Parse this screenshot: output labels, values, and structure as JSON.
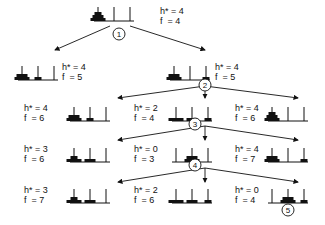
{
  "colors": {
    "ink": "#111111",
    "background": "#ffffff"
  },
  "nodes": [
    {
      "id": "root",
      "h": "h* = 4",
      "f": "f  = 4",
      "step": "1",
      "pegs": [
        [
          3,
          2,
          1
        ],
        [],
        []
      ],
      "x": 94,
      "y": 3,
      "lx": 160,
      "ly": 6
    },
    {
      "id": "n1a",
      "h": "h* = 4",
      "f": "f  = 5",
      "step": "",
      "pegs": [
        [
          3,
          2
        ],
        [
          1
        ],
        []
      ],
      "x": 18,
      "y": 62,
      "lx": 62,
      "ly": 62
    },
    {
      "id": "n1b",
      "h": "h* = 4",
      "f": "f  = 5",
      "step": "2",
      "pegs": [
        [
          3,
          2
        ],
        [],
        [
          1
        ]
      ],
      "x": 170,
      "y": 62,
      "lx": 215,
      "ly": 62
    },
    {
      "id": "n2a",
      "h": "h* = 4",
      "f": "f  = 6",
      "step": "",
      "pegs": [
        [
          3,
          2
        ],
        [
          1
        ],
        []
      ],
      "x": 70,
      "y": 103,
      "lx": 24,
      "ly": 103
    },
    {
      "id": "n2b",
      "h": "h* = 2",
      "f": "f  = 4",
      "step": "3",
      "pegs": [
        [
          3
        ],
        [
          2
        ],
        [
          1
        ]
      ],
      "x": 172,
      "y": 103,
      "lx": 134,
      "ly": 103
    },
    {
      "id": "n2c",
      "h": "h* = 4",
      "f": "f  = 6",
      "step": "",
      "pegs": [
        [
          3,
          2,
          1
        ],
        [],
        []
      ],
      "x": 268,
      "y": 103,
      "lx": 235,
      "ly": 103
    },
    {
      "id": "n3a",
      "h": "h* = 3",
      "f": "f  = 6",
      "step": "",
      "pegs": [
        [
          3,
          1
        ],
        [
          2
        ],
        []
      ],
      "x": 70,
      "y": 144,
      "lx": 24,
      "ly": 144
    },
    {
      "id": "n3b",
      "h": "h* = 0",
      "f": "f  = 3",
      "step": "4",
      "pegs": [
        [],
        [
          3,
          2
        ],
        []
      ],
      "x": 172,
      "y": 144,
      "lx": 134,
      "ly": 144
    },
    {
      "id": "n3c",
      "h": "h* = 4",
      "f": "f  = 7",
      "step": "",
      "pegs": [
        [
          3,
          2
        ],
        [],
        [
          1
        ]
      ],
      "x": 268,
      "y": 144,
      "lx": 235,
      "ly": 144
    },
    {
      "id": "n4a",
      "h": "h* = 3",
      "f": "f  = 7",
      "step": "",
      "pegs": [
        [
          3,
          1
        ],
        [
          2
        ],
        []
      ],
      "x": 70,
      "y": 185,
      "lx": 24,
      "ly": 185
    },
    {
      "id": "n4b",
      "h": "h* = 2",
      "f": "f  = 6",
      "step": "",
      "pegs": [
        [
          3
        ],
        [
          2
        ],
        [
          1
        ]
      ],
      "x": 172,
      "y": 185,
      "lx": 134,
      "ly": 185
    },
    {
      "id": "n4c",
      "h": "h* = 0",
      "f": "f  = 4",
      "step": "5",
      "pegs": [
        [],
        [
          3,
          2
        ],
        [
          1
        ]
      ],
      "x": 268,
      "y": 185,
      "lx": 235,
      "ly": 185
    }
  ],
  "edges": [
    [
      110,
      26,
      55,
      50
    ],
    [
      130,
      26,
      205,
      50
    ],
    [
      205,
      86,
      118,
      98
    ],
    [
      205,
      86,
      205,
      98
    ],
    [
      205,
      86,
      298,
      98
    ],
    [
      205,
      126,
      118,
      140
    ],
    [
      205,
      126,
      205,
      140
    ],
    [
      205,
      126,
      298,
      140
    ],
    [
      205,
      168,
      118,
      182
    ],
    [
      205,
      168,
      205,
      182
    ],
    [
      205,
      168,
      298,
      182
    ]
  ],
  "markers": [
    {
      "step": "1",
      "x": 119,
      "y": 34
    },
    {
      "step": "2",
      "x": 205,
      "y": 85
    },
    {
      "step": "3",
      "x": 195,
      "y": 124
    },
    {
      "step": "4",
      "x": 195,
      "y": 165
    },
    {
      "step": "5",
      "x": 288,
      "y": 210
    }
  ]
}
